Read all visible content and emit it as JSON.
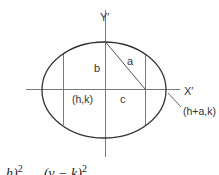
{
  "diagram": {
    "labels": {
      "y_axis": "Y′",
      "x_axis": "X′",
      "semi_major": "a",
      "semi_minor": "b",
      "focal_distance": "c",
      "center": "(h,k)",
      "vertex": "(h+a,k)"
    },
    "formula_fragment": {
      "part1": "h)",
      "part1_exp": "2",
      "part2": "(y − k)",
      "part2_exp": "2"
    },
    "colors": {
      "ellipse_stroke": "#333333",
      "axis_stroke": "#777777",
      "line_stroke": "#777777",
      "text": "#333333"
    }
  }
}
